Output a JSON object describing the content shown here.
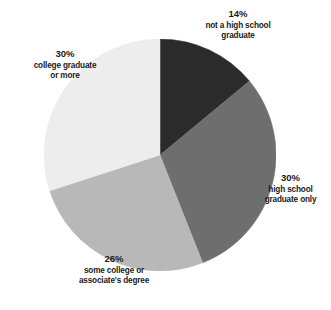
{
  "chart_data": {
    "type": "pie",
    "title": "",
    "subtitle": "",
    "xlabel": "",
    "ylabel": "",
    "legend_position": "none",
    "grid": false,
    "start_angle_deg": 0,
    "direction": "clockwise",
    "units": "percent",
    "categories": [
      "not a high school graduate",
      "high school graduate only",
      "some college or associate's degree",
      "college graduate or more"
    ],
    "values": [
      14,
      30,
      26,
      30
    ],
    "slices": [
      {
        "id": "not-a-high-school-graduate",
        "percent": 14,
        "percent_label": "14%",
        "description_lines": [
          "not a high school",
          "graduate"
        ],
        "color": "#2b2b2b",
        "start_deg": 0,
        "end_deg": 50.4
      },
      {
        "id": "high-school-graduate-only",
        "percent": 30,
        "percent_label": "30%",
        "description_lines": [
          "high school",
          "graduate only"
        ],
        "color": "#6e6e6e",
        "start_deg": 50.4,
        "end_deg": 158.4
      },
      {
        "id": "some-college-or-associates-degree",
        "percent": 26,
        "percent_label": "26%",
        "description_lines": [
          "some college or",
          "associate's degree"
        ],
        "color": "#b8b8b8",
        "start_deg": 158.4,
        "end_deg": 252.0
      },
      {
        "id": "college-graduate-or-more",
        "percent": 30,
        "percent_label": "30%",
        "description_lines": [
          "college graduate",
          "or more"
        ],
        "color": "#ededed",
        "start_deg": 252.0,
        "end_deg": 360.0
      }
    ]
  },
  "labels": {
    "not_hs": {
      "percent": "14%",
      "line1": "not a high school",
      "line2": "graduate"
    },
    "hs_only": {
      "percent": "30%",
      "line1": "high school",
      "line2": "graduate only"
    },
    "some_college": {
      "percent": "26%",
      "line1": "some college or",
      "line2": "associate's degree"
    },
    "college_grad": {
      "percent": "30%",
      "line1": "college graduate",
      "line2": "or more"
    }
  },
  "colors": {
    "slice_not_hs": "#2b2b2b",
    "slice_hs_only": "#6e6e6e",
    "slice_some_college": "#b8b8b8",
    "slice_college_grad": "#ededed",
    "text": "#1a1a1a",
    "background": "#ffffff"
  }
}
